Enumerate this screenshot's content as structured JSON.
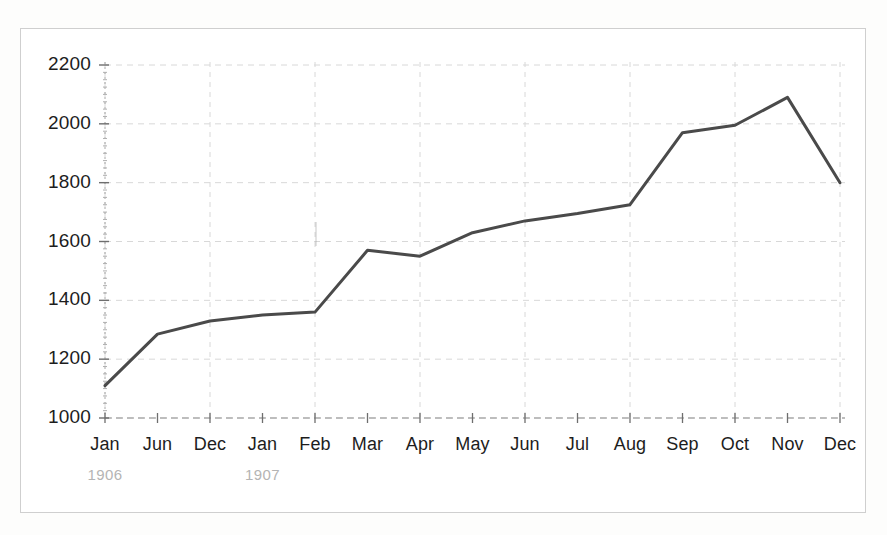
{
  "figure": {
    "frame_color": "#cfcfcf",
    "background": "#ffffff"
  },
  "chart_data": {
    "type": "line",
    "title": "",
    "subtitle": "",
    "xlabel": "",
    "ylabel": "",
    "categories": [
      "Jan",
      "Jun",
      "Dec",
      "Jan",
      "Feb",
      "Mar",
      "Apr",
      "May",
      "Jun",
      "Jul",
      "Aug",
      "Sep",
      "Oct",
      "Nov",
      "Dec"
    ],
    "values": [
      1110,
      1285,
      1330,
      1350,
      1360,
      1570,
      1550,
      1630,
      1670,
      1695,
      1725,
      1970,
      1995,
      2090,
      1800
    ],
    "series": [
      {
        "name": "series-1",
        "color": "#4a4a4a",
        "values": [
          1110,
          1285,
          1330,
          1350,
          1360,
          1570,
          1550,
          1630,
          1670,
          1695,
          1725,
          1970,
          1995,
          2090,
          1800
        ]
      }
    ],
    "group_labels": [
      {
        "text": "1906",
        "category_index": 0
      },
      {
        "text": "1907",
        "category_index": 3
      }
    ],
    "yticks": [
      1000,
      1200,
      1400,
      1600,
      1800,
      2000,
      2200
    ],
    "ytick_labels": [
      "1000",
      "1200",
      "1400",
      "1600",
      "1800",
      "2000",
      "2200"
    ],
    "ylim": [
      1000,
      2200
    ],
    "xlim": [
      0,
      14
    ],
    "grid": true,
    "grid_style": "dashed",
    "grid_color": "#d8d8d8",
    "legend": null,
    "legend_position": "none",
    "line_color": "#4a4a4a",
    "line_width": 3,
    "markers": false,
    "annotations": []
  },
  "axes": {
    "x_tick_marks": true,
    "y_tick_marks": true,
    "y_minor_ticks": true,
    "axis_color": "#9a9a9a"
  }
}
